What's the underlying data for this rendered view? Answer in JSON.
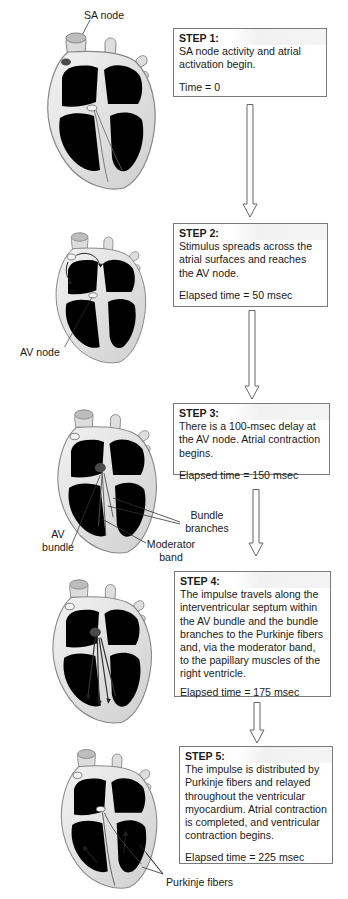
{
  "steps": [
    {
      "title": "STEP 1:",
      "text": "SA node activity and atrial activation begin.",
      "time": "Time = 0"
    },
    {
      "title": "STEP 2:",
      "text": "Stimulus spreads across the atrial surfaces and reaches the AV node.",
      "time": "Elapsed time = 50 msec"
    },
    {
      "title": "STEP 3:",
      "text": "There is a 100-msec delay at the AV node. Atrial contraction begins.",
      "time": "Elapsed time = 150 msec"
    },
    {
      "title": "STEP 4:",
      "text": "The impulse travels along the interventricular septum within the AV bundle and the bundle branches to the Purkinje fibers and, via the moderator band, to the papillary muscles of the right ventricle.",
      "time": "Elapsed time = 175 msec"
    },
    {
      "title": "STEP 5:",
      "text": "The impulse is distributed by Purkinje fibers and relayed throughout the ventricular myocardium. Atrial contraction is completed, and ventricular contraction begins.",
      "time": "Elapsed time = 225 msec"
    }
  ],
  "labels": {
    "sa_node": "SA node",
    "av_node": "AV node",
    "av_bundle_line1": "AV",
    "av_bundle_line2": "bundle",
    "bundle_branches_line1": "Bundle",
    "bundle_branches_line2": "branches",
    "moderator_band_line1": "Moderator",
    "moderator_band_line2": "band",
    "purkinje_fibers": "Purkinje fibers"
  },
  "colors": {
    "box_border": "#7a7a7a",
    "heart_outline": "#8a8a8a",
    "heart_fill": "#e4e4e4",
    "chamber_fill": "#b9b9b9",
    "active_fill": "#8f8f8f",
    "node_fill": "#4a4a4a"
  }
}
